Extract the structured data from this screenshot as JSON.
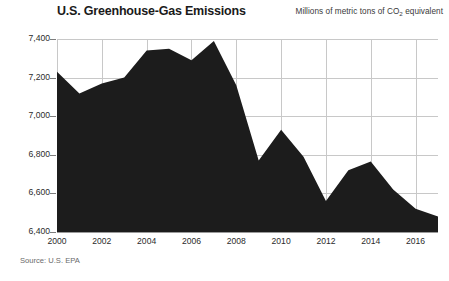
{
  "chart_data": {
    "type": "area",
    "title": "U.S. Greenhouse-Gas Emissions",
    "subtitle_prefix": "Millions of metric tons of CO",
    "subtitle_sub": "2",
    "subtitle_suffix": " equivalent",
    "source": "Source: U.S. EPA",
    "xlabel": "",
    "ylabel": "",
    "grid": true,
    "legend": "none",
    "fill_color": "#1c1c1c",
    "grid_color": "#c8c8c8",
    "xlim": [
      2000,
      2017
    ],
    "ylim": [
      6400,
      7400
    ],
    "ytick_values": [
      7400,
      7200,
      7000,
      6800,
      6600,
      6400
    ],
    "ytick_labels": [
      "7,400",
      "7,200",
      "7,000",
      "6,800",
      "6,600",
      "6,400"
    ],
    "xtick_values": [
      2000,
      2002,
      2004,
      2006,
      2008,
      2010,
      2012,
      2014,
      2016
    ],
    "xtick_labels": [
      "2000",
      "2002",
      "2004",
      "2006",
      "2008",
      "2010",
      "2012",
      "2014",
      "2016"
    ],
    "x": [
      2000,
      2001,
      2002,
      2003,
      2004,
      2005,
      2006,
      2007,
      2008,
      2009,
      2010,
      2011,
      2012,
      2013,
      2014,
      2015,
      2016,
      2017
    ],
    "values": [
      7230,
      7118,
      7170,
      7200,
      7340,
      7350,
      7290,
      7390,
      7160,
      6770,
      6930,
      6790,
      6560,
      6720,
      6765,
      6620,
      6520,
      6480
    ],
    "series": [
      {
        "name": "U.S. Greenhouse-Gas Emissions",
        "values": [
          7230,
          7118,
          7170,
          7200,
          7340,
          7350,
          7290,
          7390,
          7160,
          6770,
          6930,
          6790,
          6560,
          6720,
          6765,
          6620,
          6520,
          6480
        ]
      }
    ]
  }
}
